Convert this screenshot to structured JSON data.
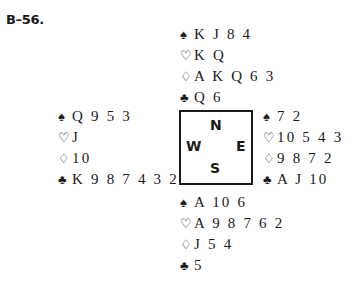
{
  "problem_label": "B–56.",
  "suits": {
    "spades": "♠",
    "hearts": "♡",
    "diamonds": "♢",
    "clubs": "♣"
  },
  "compass": {
    "north": "N",
    "south": "S",
    "east": "E",
    "west": "W"
  },
  "hands": {
    "north": {
      "spades": "K J 8 4",
      "hearts": "K Q",
      "diamonds": "A K Q 6 3",
      "clubs": "Q 6"
    },
    "west": {
      "spades": "Q 9 5 3",
      "hearts": "J",
      "diamonds": "10",
      "clubs": "K 9 8 7 4 3 2"
    },
    "east": {
      "spades": "7 2",
      "hearts": "10 5 4 3",
      "diamonds": "9 8 7 2",
      "clubs": "A J 10"
    },
    "south": {
      "spades": "A 10 6",
      "hearts": "A 9 8 7 6 2",
      "diamonds": "J 5 4",
      "clubs": "5"
    }
  }
}
